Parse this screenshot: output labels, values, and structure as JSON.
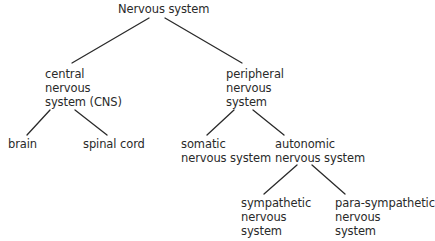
{
  "diagram": {
    "type": "tree",
    "title": "Nervous system",
    "line_color": "#2a2a2a",
    "text_color": "#2a2a2a",
    "nodes": {
      "root": {
        "lines": [
          "Nervous system"
        ]
      },
      "cns": {
        "lines": [
          "central",
          "nervous",
          "system (CNS)"
        ]
      },
      "pns": {
        "lines": [
          "peripheral",
          "nervous",
          "system"
        ]
      },
      "brain": {
        "lines": [
          "brain"
        ]
      },
      "spinal_cord": {
        "lines": [
          "spinal cord"
        ]
      },
      "somatic": {
        "lines": [
          "somatic",
          "nervous system"
        ]
      },
      "autonomic": {
        "lines": [
          "autonomic",
          "nervous system"
        ]
      },
      "sympathetic": {
        "lines": [
          "sympathetic",
          "nervous",
          "system"
        ]
      },
      "parasympathetic": {
        "lines": [
          "para-sympathetic",
          "nervous",
          "system"
        ]
      }
    },
    "edges": [
      [
        "root",
        "cns"
      ],
      [
        "root",
        "pns"
      ],
      [
        "cns",
        "brain"
      ],
      [
        "cns",
        "spinal_cord"
      ],
      [
        "pns",
        "somatic"
      ],
      [
        "pns",
        "autonomic"
      ],
      [
        "autonomic",
        "sympathetic"
      ],
      [
        "autonomic",
        "parasympathetic"
      ]
    ]
  }
}
